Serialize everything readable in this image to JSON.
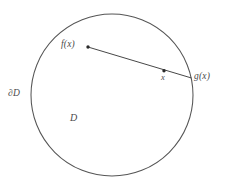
{
  "figure": {
    "background_color": "#ffffff",
    "stroke_color": "#555555",
    "label_color": "#4a4a4a",
    "labels": {
      "domain_boundary": "∂D",
      "domain_interior": "D",
      "point_fx": "f(x)",
      "point_x": "x",
      "point_gx": "g(x)"
    },
    "geometry": {
      "circle": {
        "cx": 112,
        "cy": 95,
        "r": 81
      },
      "segment": {
        "x1": 88,
        "y1": 47,
        "x2": 191.5,
        "y2": 78
      },
      "markers": [
        {
          "name": "fx",
          "x": 88,
          "y": 47,
          "r": 1.7
        },
        {
          "name": "x",
          "x": 164,
          "y": 70.7,
          "r": 1.7
        }
      ]
    }
  }
}
